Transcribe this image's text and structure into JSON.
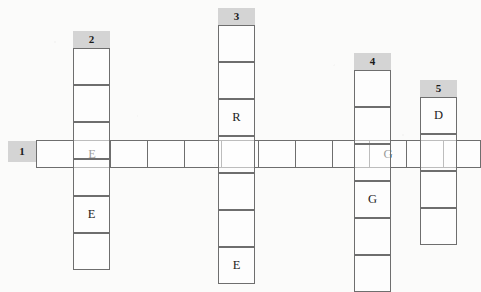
{
  "puzzle": {
    "type": "crossword-grid",
    "cell_size": 37,
    "grid_color": "#6e6e6e",
    "number_tab_color": "#d4d4d4",
    "background_color": "#fbfbfa",
    "entries": [
      {
        "number": "1",
        "direction": "across",
        "tab": {
          "x": 8,
          "y": 141,
          "w": 28,
          "h": 21
        },
        "origin": {
          "x": 36,
          "y": 140
        },
        "length": 12,
        "cells": [
          {
            "letter": ""
          },
          {
            "letter": "E"
          },
          {
            "letter": ""
          },
          {
            "letter": ""
          },
          {
            "letter": ""
          },
          {
            "letter": ""
          },
          {
            "letter": ""
          },
          {
            "letter": ""
          },
          {
            "letter": ""
          },
          {
            "letter": "G"
          },
          {
            "letter": ""
          },
          {
            "letter": ""
          }
        ]
      },
      {
        "number": "2",
        "direction": "down",
        "tab": {
          "x": 73,
          "y": 31,
          "w": 37,
          "h": 17
        },
        "origin": {
          "x": 73,
          "y": 48
        },
        "length": 6,
        "cross_index": 4,
        "cells": [
          {
            "letter": ""
          },
          {
            "letter": ""
          },
          {
            "letter": ""
          },
          {
            "letter": ""
          },
          {
            "letter": "E"
          },
          {
            "letter": ""
          }
        ]
      },
      {
        "number": "3",
        "direction": "down",
        "tab": {
          "x": 218,
          "y": 8,
          "w": 37,
          "h": 17
        },
        "origin": {
          "x": 218,
          "y": 25
        },
        "length": 7,
        "cross_index": 5,
        "cells": [
          {
            "letter": ""
          },
          {
            "letter": ""
          },
          {
            "letter": "R"
          },
          {
            "letter": ""
          },
          {
            "letter": ""
          },
          {
            "letter": ""
          },
          {
            "letter": "E"
          }
        ]
      },
      {
        "number": "4",
        "direction": "down",
        "tab": {
          "x": 354,
          "y": 53,
          "w": 37,
          "h": 17
        },
        "origin": {
          "x": 354,
          "y": 70
        },
        "length": 6,
        "cross_index": 3,
        "cells": [
          {
            "letter": ""
          },
          {
            "letter": ""
          },
          {
            "letter": ""
          },
          {
            "letter": "G"
          },
          {
            "letter": ""
          },
          {
            "letter": ""
          }
        ]
      },
      {
        "number": "5",
        "direction": "down",
        "tab": {
          "x": 420,
          "y": 80,
          "w": 37,
          "h": 17
        },
        "origin": {
          "x": 420,
          "y": 97
        },
        "length": 4,
        "cross_index": 2,
        "cells": [
          {
            "letter": "D"
          },
          {
            "letter": ""
          },
          {
            "letter": ""
          },
          {
            "letter": ""
          }
        ]
      }
    ]
  }
}
